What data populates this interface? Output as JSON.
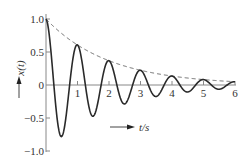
{
  "chart_data": {
    "type": "line",
    "title": "",
    "xlabel": "t/s",
    "ylabel": "x(t)",
    "xlim": [
      0,
      6
    ],
    "ylim": [
      -1.0,
      1.0
    ],
    "grid": false,
    "legend": null,
    "x_ticks": [
      "1",
      "2",
      "3",
      "4",
      "5",
      "6"
    ],
    "y_ticks": [
      "1.0",
      "0.5",
      "0",
      "-0.5",
      "-1.0"
    ],
    "series": [
      {
        "name": "x(t)",
        "style": "solid",
        "formula": "exp(-0.5 t) cos(2 pi t)",
        "x": [
          0,
          0.5,
          1,
          1.5,
          2,
          2.5,
          3,
          3.5,
          4,
          4.5,
          5,
          5.5,
          6
        ],
        "values": [
          1.0,
          -0.78,
          0.61,
          -0.47,
          0.37,
          -0.29,
          0.22,
          -0.17,
          0.14,
          -0.11,
          0.08,
          -0.06,
          0.05
        ]
      },
      {
        "name": "envelope",
        "style": "dashed",
        "formula": "exp(-0.5 t)",
        "x": [
          0,
          1,
          2,
          3,
          4,
          5,
          6
        ],
        "values": [
          1.0,
          0.61,
          0.37,
          0.22,
          0.14,
          0.08,
          0.05
        ]
      }
    ],
    "decay_rate": 0.5,
    "frequency_hz": 1
  },
  "labels": {
    "y_axis": "x(t)",
    "x_axis": "t/s",
    "y_ticks": [
      "1.0",
      "0.5",
      "0",
      "−0.5",
      "−1.0"
    ],
    "x_ticks": [
      "1",
      "2",
      "3",
      "4",
      "5",
      "6"
    ]
  },
  "colors": {
    "curve": "#2a2a2a",
    "axis": "#777777",
    "envelope": "#555555"
  }
}
